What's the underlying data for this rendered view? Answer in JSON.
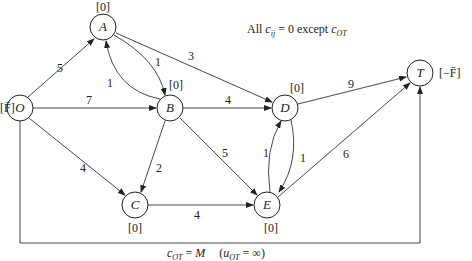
{
  "diagram": {
    "title_note": {
      "prefix": "All ",
      "c": "c",
      "c_sub": "ij",
      "middle": " = 0 except ",
      "c2": "c",
      "c2_sub": "OT"
    },
    "nodes": [
      {
        "id": "O",
        "label": "O",
        "supply": "[F̄]"
      },
      {
        "id": "A",
        "label": "A",
        "supply": "[0]"
      },
      {
        "id": "B",
        "label": "B",
        "supply": "[0]"
      },
      {
        "id": "C",
        "label": "C",
        "supply": "[0]"
      },
      {
        "id": "D",
        "label": "D",
        "supply": "[0]"
      },
      {
        "id": "E",
        "label": "E",
        "supply": "[0]"
      },
      {
        "id": "T",
        "label": "T",
        "supply": "[−F̄]"
      }
    ],
    "edges": [
      {
        "from": "O",
        "to": "A",
        "capacity": "5"
      },
      {
        "from": "O",
        "to": "B",
        "capacity": "7"
      },
      {
        "from": "O",
        "to": "C",
        "capacity": "4"
      },
      {
        "from": "A",
        "to": "B",
        "capacity": "1"
      },
      {
        "from": "B",
        "to": "A",
        "capacity": "1"
      },
      {
        "from": "A",
        "to": "D",
        "capacity": "3"
      },
      {
        "from": "B",
        "to": "D",
        "capacity": "4"
      },
      {
        "from": "B",
        "to": "C",
        "capacity": "2"
      },
      {
        "from": "B",
        "to": "E",
        "capacity": "5"
      },
      {
        "from": "C",
        "to": "E",
        "capacity": "4"
      },
      {
        "from": "E",
        "to": "D",
        "capacity": "1"
      },
      {
        "from": "D",
        "to": "E",
        "capacity": "1"
      },
      {
        "from": "D",
        "to": "T",
        "capacity": "9"
      },
      {
        "from": "E",
        "to": "T",
        "capacity": "6"
      },
      {
        "from": "O",
        "to": "T",
        "capacity": "∞",
        "cost": "M"
      }
    ],
    "bottom_note": {
      "c": "c",
      "c_sub": "OT",
      "eq1": " = ",
      "M": "M",
      "paren_open": "(",
      "u": "u",
      "u_sub": "OT",
      "eq2": " = ∞)"
    }
  }
}
